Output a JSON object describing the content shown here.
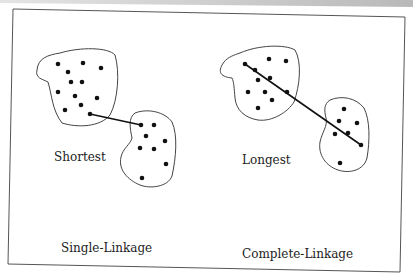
{
  "diagram": {
    "colors": {
      "background": "#ffffff",
      "top_band_left": "#e4e4e4",
      "top_band_right": "#b9b9b9",
      "frame": "#555555",
      "outline": "#444444",
      "dot": "#111111",
      "link": "#111111",
      "text": "#222222"
    },
    "frame": {
      "points": [
        [
          13,
          9
        ],
        [
          405,
          17
        ],
        [
          400,
          272
        ],
        [
          8,
          264
        ]
      ]
    },
    "panels": [
      {
        "id": "single",
        "distance_label": "Shortest",
        "distance_label_pos": [
          54,
          161
        ],
        "title": "Single-Linkage",
        "title_pos": [
          61,
          252
        ],
        "cluster_a": {
          "outline": "M60,53 C80,47 108,47 115,55 C120,72 118,100 110,115 C100,127 78,128 62,123 C52,110 52,95 48,82 C42,79 35,78 37,70 C38,58 48,55 60,53 Z",
          "dots": [
            [
              58,
              64
            ],
            [
              83,
              63
            ],
            [
              101,
              68
            ],
            [
              68,
              72
            ],
            [
              71,
              82
            ],
            [
              82,
              82
            ],
            [
              58,
              92
            ],
            [
              75,
              96
            ],
            [
              97,
              98
            ],
            [
              65,
              110
            ],
            [
              81,
              105
            ],
            [
              90,
              114
            ]
          ]
        },
        "cluster_b": {
          "outline": "M135,113 C148,108 165,112 172,122 C178,135 176,158 172,176 C168,187 150,189 140,185 C128,180 118,170 121,157 C123,148 130,145 132,138 C130,128 128,118 135,113 Z",
          "dots": [
            [
              141,
              125
            ],
            [
              154,
              125
            ],
            [
              146,
              136
            ],
            [
              165,
              141
            ],
            [
              140,
              148
            ],
            [
              154,
              149
            ],
            [
              166,
              164
            ],
            [
              142,
              178
            ]
          ]
        },
        "link": [
          [
            90,
            114
          ],
          [
            141,
            125
          ]
        ]
      },
      {
        "id": "complete",
        "distance_label": "Longest",
        "distance_label_pos": [
          242,
          164
        ],
        "title": "Complete-Linkage",
        "title_pos": [
          242,
          258
        ],
        "cluster_a": {
          "outline": "M240,53 C258,45 285,44 295,50 C302,62 300,85 294,102 C288,112 272,122 258,120 C245,118 236,110 235,98 C234,88 234,82 232,78 C222,77 216,73 224,62 C228,57 234,55 240,53 Z",
          "dots": [
            [
              245,
              64
            ],
            [
              269,
              59
            ],
            [
              286,
              61
            ],
            [
              255,
              70
            ],
            [
              258,
              80
            ],
            [
              270,
              78
            ],
            [
              248,
              92
            ],
            [
              265,
              92
            ],
            [
              287,
              92
            ],
            [
              272,
              100
            ],
            [
              258,
              108
            ]
          ]
        },
        "cluster_b": {
          "outline": "M330,100 C342,95 356,98 364,108 C370,120 370,140 367,158 C364,170 350,174 338,170 C326,166 318,155 320,142 C322,132 328,126 326,118 C324,110 324,104 330,100 Z",
          "dots": [
            [
              344,
              109
            ],
            [
              339,
              121
            ],
            [
              357,
              123
            ],
            [
              335,
              134
            ],
            [
              348,
              133
            ],
            [
              361,
              145
            ],
            [
              340,
              163
            ]
          ]
        },
        "link": [
          [
            245,
            64
          ],
          [
            361,
            145
          ]
        ]
      }
    ]
  }
}
